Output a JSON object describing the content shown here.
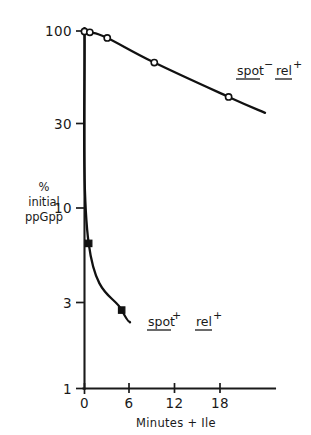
{
  "figure": {
    "background_color": "#ffffff",
    "ink_color": "#111111"
  },
  "axes": {
    "y": {
      "label_line1": "%",
      "label_line2": "initial",
      "label_line3": "ppGpp",
      "scale": "log",
      "ticks": [
        "100",
        "30",
        "10",
        "3",
        "1"
      ]
    },
    "x": {
      "title": "Minutes + Ile",
      "ticks": [
        "0",
        "6",
        "12",
        "18"
      ]
    }
  },
  "annotations": {
    "upper": {
      "gene1": "spot",
      "sup1": "−",
      "gene2": "rel",
      "sup2": "+"
    },
    "lower": {
      "gene1": "spot",
      "sup1": "+",
      "gene2": "rel",
      "sup2": "+"
    }
  },
  "chart_data": {
    "type": "line",
    "title": "",
    "xlabel": "Minutes + Ile",
    "ylabel": "% initial ppGpp",
    "xlim": [
      0,
      25
    ],
    "ylim": [
      1,
      100
    ],
    "yscale": "log",
    "xticks": [
      0,
      6,
      12,
      18
    ],
    "yticks": [
      1,
      3,
      10,
      30,
      100
    ],
    "grid": false,
    "legend_position": "inline-annotation",
    "series": [
      {
        "name": "spot- rel+",
        "marker": "open-circle",
        "x": [
          0.0,
          0.7,
          3.0,
          9.2,
          19.0
        ],
        "y": [
          100.0,
          99.0,
          92.0,
          67.0,
          43.0
        ],
        "line_x": [
          0.0,
          0.7,
          3.0,
          9.2,
          19.0,
          23.8
        ],
        "line_y": [
          100.0,
          99.0,
          92.0,
          67.0,
          43.0,
          35.0
        ]
      },
      {
        "name": "spot+ rel+",
        "marker": "filled-square",
        "x": [
          0.0,
          0.55,
          4.9
        ],
        "y": [
          100.0,
          6.5,
          2.75
        ],
        "line_x": [
          0.0,
          0.55,
          4.9,
          6.0
        ],
        "line_y": [
          100.0,
          6.5,
          2.75,
          2.35
        ]
      }
    ]
  }
}
